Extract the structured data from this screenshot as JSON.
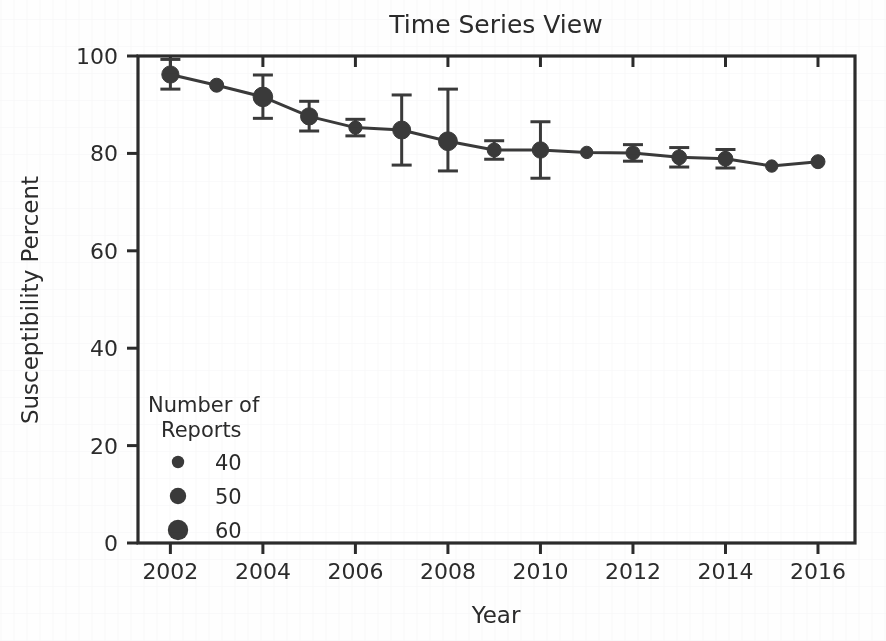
{
  "chart_data": {
    "type": "line",
    "title": "Time Series View",
    "xlabel": "Year",
    "ylabel": "Susceptibility Percent",
    "xlim": [
      2001.3,
      2016.8
    ],
    "ylim": [
      0,
      100
    ],
    "xticks": [
      2002,
      2004,
      2006,
      2008,
      2010,
      2012,
      2014,
      2016
    ],
    "xtick_labels": [
      "2002",
      "2004",
      "2006",
      "2008",
      "2010",
      "2012",
      "2014",
      "2016"
    ],
    "yticks": [
      0,
      20,
      40,
      60,
      80,
      100
    ],
    "ytick_labels": [
      "0",
      "20",
      "40",
      "60",
      "80",
      "100"
    ],
    "grid": false,
    "legend_position": "lower-left-inside",
    "marker_color": "#3a3a3a",
    "line_color": "#3a3a3a",
    "x": [
      2002,
      2003,
      2004,
      2005,
      2006,
      2007,
      2008,
      2009,
      2010,
      2011,
      2012,
      2013,
      2014,
      2015,
      2016
    ],
    "values": [
      96.2,
      94.0,
      91.6,
      87.6,
      85.3,
      84.8,
      82.5,
      80.7,
      80.7,
      80.2,
      80.1,
      79.2,
      78.9,
      77.4,
      78.3
    ],
    "err_low": [
      93.2,
      94.0,
      87.2,
      84.6,
      83.6,
      77.6,
      76.4,
      78.8,
      74.9,
      80.2,
      78.4,
      77.2,
      77.0,
      77.4,
      78.3
    ],
    "err_high": [
      99.3,
      94.0,
      96.1,
      90.7,
      87.0,
      92.0,
      93.2,
      82.6,
      86.5,
      80.2,
      81.8,
      81.2,
      80.8,
      77.4,
      78.3
    ],
    "sizes": [
      52,
      44,
      58,
      52,
      42,
      54,
      56,
      44,
      50,
      40,
      44,
      46,
      46,
      40,
      44
    ],
    "size_legend": {
      "title_line1": "Number of",
      "title_line2": "Reports",
      "entries": [
        {
          "label": "40",
          "size": 40
        },
        {
          "label": "50",
          "size": 50
        },
        {
          "label": "60",
          "size": 60
        }
      ]
    }
  }
}
